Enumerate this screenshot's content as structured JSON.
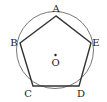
{
  "diagram": {
    "type": "geometry",
    "circle": {
      "cx": 55,
      "cy": 50,
      "r": 38.5
    },
    "center": {
      "label": "O",
      "x": 55.5,
      "y": 55
    },
    "vertices": [
      {
        "label": "A",
        "x": 56,
        "y": 16
      },
      {
        "label": "B",
        "x": 20,
        "y": 43
      },
      {
        "label": "C",
        "x": 33,
        "y": 86
      },
      {
        "label": "D",
        "x": 79,
        "y": 86
      },
      {
        "label": "E",
        "x": 91,
        "y": 43
      }
    ],
    "colors": {
      "stroke": "#333333",
      "circle": "#555555"
    }
  }
}
